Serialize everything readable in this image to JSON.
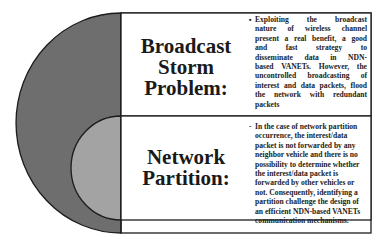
{
  "colors": {
    "outer_arc_fill": "#6e6e6e",
    "inner_arc_fill": "#a3a3a3",
    "stroke": "#1c1c1c",
    "box_fill": "#ffffff"
  },
  "sections": [
    {
      "title_lines": [
        "Broadcast",
        "Storm",
        "Problem:"
      ],
      "bullet": "▪",
      "body_lines": [
        "Exploiting the broadcast",
        "nature of wireless channel",
        "present a real benefit, a good",
        "and fast strategy to",
        "disseminate data in NDN-",
        "based VANETs. However, the",
        "uncontrolled broadcasting of",
        "interest and data packets, flood",
        "the network with redundant",
        "packets"
      ]
    },
    {
      "title_lines": [
        "Network",
        "Partition:"
      ],
      "bullet": "-",
      "body_lines": [
        "In the case of network partition",
        "occurrence, the interest/data",
        "packet is not forwarded by any",
        "neighbor vehicle and there is no",
        "possibility to determine whether",
        "the interest/data packet is",
        "forwarded by other vehicles or",
        "not. Consequently, identifying a",
        "partition challenge the design of",
        "an efficient NDN-based VANETs",
        "communication mechanisms."
      ]
    }
  ]
}
